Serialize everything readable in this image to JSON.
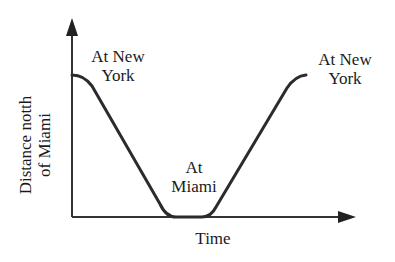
{
  "diagram": {
    "y_axis_label_line1": "Distance notth",
    "y_axis_label_line2": "of Miami",
    "x_axis_label": "Time",
    "annotations": {
      "start_line1": "At New",
      "start_line2": "York",
      "middle_line1": "At",
      "middle_line2": "Miami",
      "end_line1": "At New",
      "end_line2": "York"
    },
    "curve_shape": "trapezoidal dip: starts high at New York, descends linearly to Miami (zero), stays flat, rises linearly back to New York",
    "colors": {
      "line": "#2b2b2b",
      "axes": "#333333",
      "text": "#1a1a1a",
      "background": "#ffffff"
    }
  }
}
